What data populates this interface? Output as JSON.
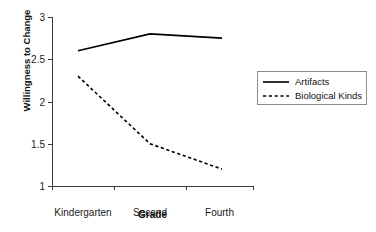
{
  "chart_data": {
    "type": "line",
    "title": "",
    "xlabel": "Grade",
    "ylabel": "Willingness to Change",
    "categories": [
      "Kindergarten",
      "Second",
      "Fourth"
    ],
    "ylim": [
      1,
      3
    ],
    "yticks": [
      "1",
      "1.5",
      "2",
      "2.5",
      "3"
    ],
    "ytick_values": [
      1,
      1.5,
      2,
      2.5,
      3
    ],
    "grid": false,
    "legend_position": "right",
    "series": [
      {
        "name": "Artifacts",
        "style": "solid",
        "color": "#000000",
        "values": [
          2.6,
          2.8,
          2.75
        ]
      },
      {
        "name": "Biological Kinds",
        "style": "dashed",
        "color": "#000000",
        "values": [
          2.3,
          1.5,
          1.2
        ]
      }
    ]
  },
  "legend": {
    "items": [
      {
        "label": "Artifacts",
        "style": "solid"
      },
      {
        "label": "Biological Kinds",
        "style": "dashed"
      }
    ]
  }
}
